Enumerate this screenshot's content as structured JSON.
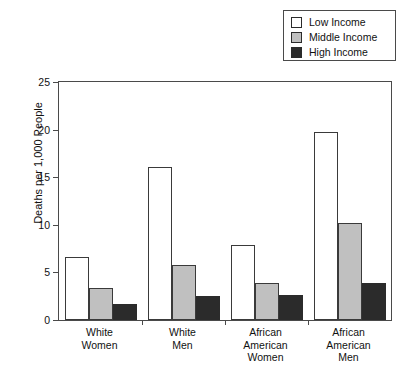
{
  "chart_data": {
    "type": "bar",
    "title": "",
    "xlabel": "",
    "ylabel": "Deaths per 1,000 People",
    "ylim": [
      0,
      25
    ],
    "yticks": [
      0,
      5,
      10,
      15,
      20,
      25
    ],
    "grid": false,
    "legend_position": "top-right",
    "categories": [
      "White Women",
      "White Men",
      "African American Women",
      "African American Men"
    ],
    "category_lines": [
      [
        "White",
        "Women"
      ],
      [
        "White",
        "Men"
      ],
      [
        "African",
        "American",
        "Women"
      ],
      [
        "African",
        "American",
        "Men"
      ]
    ],
    "series": [
      {
        "name": "Low Income",
        "color": "#ffffff",
        "values": [
          6.6,
          16.1,
          7.9,
          19.7
        ]
      },
      {
        "name": "Middle Income",
        "color": "#c0c0c0",
        "values": [
          3.4,
          5.8,
          3.9,
          10.2
        ]
      },
      {
        "name": "High Income",
        "color": "#2b2b2b",
        "values": [
          1.7,
          2.5,
          2.6,
          3.9
        ]
      }
    ]
  },
  "legend": {
    "items": [
      {
        "label": "Low Income",
        "swatch": "#ffffff"
      },
      {
        "label": "Middle Income",
        "swatch": "#c0c0c0"
      },
      {
        "label": "High Income",
        "swatch": "#2b2b2b"
      }
    ]
  },
  "axes": {
    "y_title": "Deaths per 1,000 People",
    "y_tick_labels": [
      "0",
      "5",
      "10",
      "15",
      "20",
      "25"
    ]
  }
}
